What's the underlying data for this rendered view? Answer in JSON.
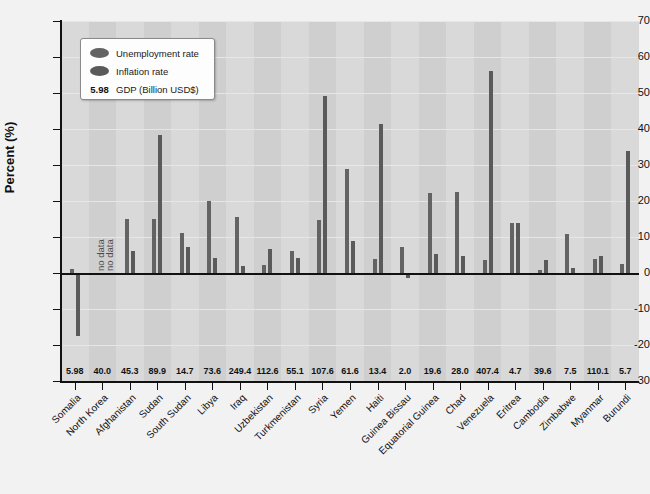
{
  "chart_data": {
    "type": "bar",
    "title": "",
    "xlabel": "",
    "ylabel": "Percent (%)",
    "ylim": [
      -30,
      70
    ],
    "ytick_values": [
      70,
      60,
      50,
      40,
      30,
      20,
      10,
      0,
      -10,
      -20,
      -30
    ],
    "ytick_labels": [
      "70",
      "60",
      "50",
      "40",
      "30",
      "20",
      "10",
      "0",
      "-10",
      "-20",
      "-30"
    ],
    "grid": true,
    "legend_position": "top-left",
    "legend": [
      {
        "kind": "swatch",
        "name": "unemployment",
        "label": "Unemployment rate",
        "color": "#636363"
      },
      {
        "kind": "swatch",
        "name": "inflation",
        "label": "Inflation rate",
        "color": "#5a5a5a"
      },
      {
        "kind": "value",
        "name": "gdp",
        "value": "5.98",
        "label": "GDP (Billion USD$)"
      }
    ],
    "categories": [
      "Somalia",
      "North Korea",
      "Afghanistan",
      "Sudan",
      "South Sudan",
      "Libya",
      "Iraq",
      "Uzbekistan",
      "Turkmenistan",
      "Syria",
      "Yemen",
      "Haiti",
      "Guinea Bissau",
      "Equatorial Guinea",
      "Chad",
      "Venezuela",
      "Eritrea",
      "Cambodia",
      "Zimbabwe",
      "Myanmar",
      "Burundi"
    ],
    "series": [
      {
        "name": "Unemployment rate",
        "color": "#636363",
        "values": [
          1.0,
          null,
          15.0,
          14.9,
          11.2,
          20.1,
          15.6,
          2.3,
          6.1,
          14.8,
          29.0,
          3.9,
          7.2,
          22.1,
          22.5,
          3.6,
          14.0,
          0.9,
          10.7,
          4.0,
          2.5
        ]
      },
      {
        "name": "Inflation rate",
        "color": "#5a5a5a",
        "values": [
          -17.5,
          null,
          6.0,
          38.3,
          7.2,
          4.1,
          2.0,
          6.6,
          4.2,
          49.2,
          9.0,
          41.3,
          -1.5,
          5.2,
          4.6,
          56.2,
          13.8,
          3.5,
          1.4,
          4.6,
          34.0
        ]
      }
    ],
    "gdp_values": [
      "5.98",
      "40.0",
      "45.3",
      "89.9",
      "14.7",
      "73.6",
      "249.4",
      "112.6",
      "55.1",
      "107.6",
      "61.6",
      "13.4",
      "2.0",
      "19.6",
      "28.0",
      "407.4",
      "4.7",
      "39.6",
      "7.5",
      "110.1",
      "5.7"
    ],
    "annotations": [
      {
        "category": "North Korea",
        "series": "Unemployment rate",
        "text": "no data"
      },
      {
        "category": "North Korea",
        "series": "Inflation rate",
        "text": "no data"
      }
    ]
  }
}
